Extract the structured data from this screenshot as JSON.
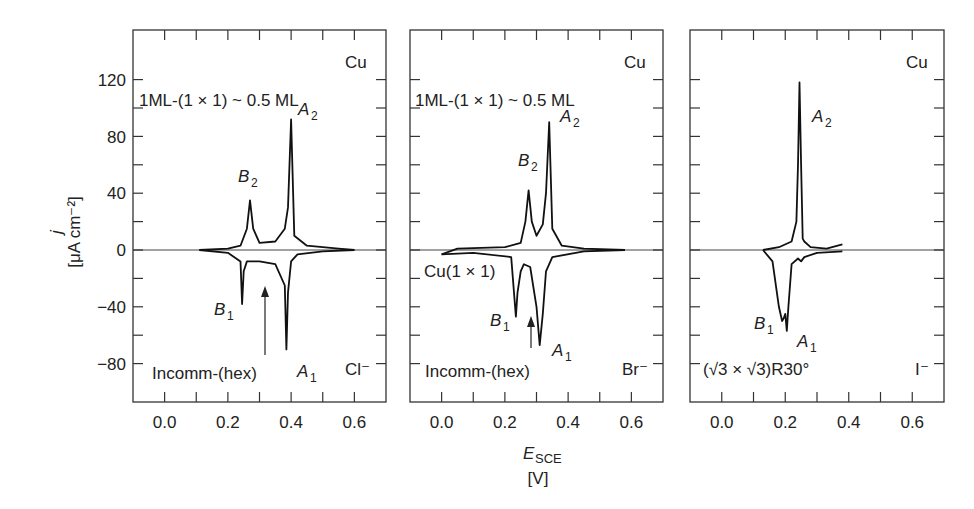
{
  "figure": {
    "ylabel_symbol": "j",
    "ylabel_units": "[μA cm⁻²]",
    "xlabel_symbol": "E",
    "xlabel_subscript": "SCE",
    "xlabel_units": "[V]",
    "yticks": [
      "120",
      "80",
      "40",
      "0",
      "−40",
      "−80"
    ],
    "xticks": [
      "0.0",
      "0.2",
      "0.4",
      "0.6"
    ]
  },
  "panels": [
    {
      "id": "cl",
      "electrolyte": "Cl⁻",
      "metal": "Cu",
      "top_label": "1ML-(1 × 1) ~ 0.5 ML",
      "structure_label": "Incomm-(hex)",
      "extra_label": "",
      "peaks": {
        "A2": "A",
        "B2": "B",
        "B1": "B",
        "A1": "A"
      }
    },
    {
      "id": "br",
      "electrolyte": "Br⁻",
      "metal": "Cu",
      "top_label": "1ML-(1 × 1) ~ 0.5 ML",
      "structure_label": "Incomm-(hex)",
      "extra_label": "Cu(1 × 1)",
      "peaks": {
        "A2": "A",
        "B2": "B",
        "B1": "B",
        "A1": "A"
      }
    },
    {
      "id": "i",
      "electrolyte": "I⁻",
      "metal": "Cu",
      "top_label": "",
      "structure_label": "(√3 × √3)R30°",
      "extra_label": "",
      "peaks": {
        "A2": "A",
        "A1": "A",
        "B1": "B"
      }
    }
  ],
  "chart_data": [
    {
      "type": "line",
      "title": "Cu UPD on Au(111) in Cl⁻",
      "xlabel": "E_SCE [V]",
      "ylabel": "j [μA cm⁻²]",
      "xlim": [
        -0.1,
        0.7
      ],
      "ylim": [
        -90,
        130
      ],
      "xticks": [
        0.0,
        0.2,
        0.4,
        0.6
      ],
      "yticks": [
        -80,
        -40,
        0,
        40,
        80,
        120
      ],
      "grid": false,
      "annotations": [
        "1ML-(1 × 1) ~ 0.5 ML",
        "Cu",
        "B2",
        "A2",
        "B1",
        "A1",
        "Incomm-(hex)",
        "Cl⁻"
      ],
      "series": [
        {
          "name": "anodic",
          "x": [
            0.11,
            0.2,
            0.24,
            0.26,
            0.27,
            0.28,
            0.3,
            0.35,
            0.38,
            0.39,
            0.4,
            0.41,
            0.45,
            0.55,
            0.6
          ],
          "y": [
            0,
            1,
            3,
            15,
            35,
            15,
            5,
            6,
            15,
            30,
            92,
            10,
            3,
            1,
            0
          ]
        },
        {
          "name": "cathodic",
          "x": [
            0.6,
            0.5,
            0.42,
            0.4,
            0.39,
            0.385,
            0.38,
            0.35,
            0.3,
            0.26,
            0.25,
            0.245,
            0.24,
            0.2,
            0.11
          ],
          "y": [
            0,
            -1,
            -3,
            -8,
            -30,
            -70,
            -25,
            -10,
            -8,
            -8,
            -15,
            -38,
            -8,
            -2,
            0
          ]
        }
      ]
    },
    {
      "type": "line",
      "title": "Cu UPD on Au(111) in Br⁻",
      "xlabel": "E_SCE [V]",
      "ylabel": "j [μA cm⁻²]",
      "xlim": [
        -0.1,
        0.7
      ],
      "ylim": [
        -90,
        130
      ],
      "xticks": [
        0.0,
        0.2,
        0.4,
        0.6
      ],
      "yticks": [
        -80,
        -40,
        0,
        40,
        80,
        120
      ],
      "grid": false,
      "annotations": [
        "1ML-(1 × 1) ~ 0.5 ML",
        "Cu",
        "B2",
        "A2",
        "Cu(1 × 1)",
        "B1",
        "A1",
        "Incomm-(hex)",
        "Br⁻"
      ],
      "series": [
        {
          "name": "anodic",
          "x": [
            0.0,
            0.05,
            0.2,
            0.25,
            0.265,
            0.275,
            0.285,
            0.3,
            0.32,
            0.33,
            0.34,
            0.35,
            0.38,
            0.45,
            0.58
          ],
          "y": [
            -3,
            1,
            2,
            5,
            20,
            42,
            20,
            10,
            18,
            40,
            90,
            15,
            3,
            1,
            0
          ]
        },
        {
          "name": "cathodic",
          "x": [
            0.58,
            0.45,
            0.35,
            0.33,
            0.32,
            0.31,
            0.3,
            0.28,
            0.26,
            0.25,
            0.24,
            0.235,
            0.22,
            0.1,
            0.0
          ],
          "y": [
            0,
            -1,
            -5,
            -15,
            -45,
            -67,
            -40,
            -12,
            -10,
            -15,
            -30,
            -47,
            -5,
            -2,
            -3
          ]
        }
      ]
    },
    {
      "type": "line",
      "title": "Cu UPD on Au(111) in I⁻",
      "xlabel": "E_SCE [V]",
      "ylabel": "j [μA cm⁻²]",
      "xlim": [
        -0.1,
        0.7
      ],
      "ylim": [
        -90,
        130
      ],
      "xticks": [
        0.0,
        0.2,
        0.4,
        0.6
      ],
      "yticks": [
        -80,
        -40,
        0,
        40,
        80,
        120
      ],
      "grid": false,
      "annotations": [
        "Cu",
        "A2",
        "B1",
        "A1",
        "(√3 × √3)R30°",
        "I⁻"
      ],
      "series": [
        {
          "name": "anodic",
          "x": [
            0.13,
            0.18,
            0.22,
            0.235,
            0.24,
            0.245,
            0.25,
            0.255,
            0.26,
            0.28,
            0.33,
            0.38
          ],
          "y": [
            0,
            2,
            6,
            20,
            60,
            118,
            60,
            8,
            6,
            2,
            1,
            4
          ]
        },
        {
          "name": "cathodic",
          "x": [
            0.38,
            0.3,
            0.26,
            0.25,
            0.24,
            0.22,
            0.21,
            0.205,
            0.2,
            0.195,
            0.19,
            0.18,
            0.16,
            0.13
          ],
          "y": [
            -1,
            -2,
            -5,
            -8,
            -6,
            -10,
            -40,
            -57,
            -45,
            -48,
            -50,
            -40,
            -8,
            0
          ]
        }
      ]
    }
  ]
}
